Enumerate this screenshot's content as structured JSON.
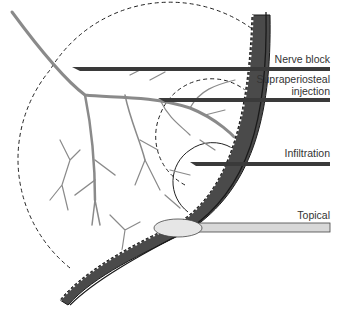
{
  "diagram": {
    "labels": {
      "nerve_block": "Nerve block",
      "supraperiosteal": "Supraperiosteal\ninjection",
      "infiltration": "Infiltration",
      "topical": "Topical"
    },
    "colors": {
      "nerve": "#8a8a8a",
      "mucosa_fill": "#4a4a4a",
      "bone_line": "#1a1a1a",
      "needle": "#3a3a3a",
      "dashed": "#222222",
      "swab": "#d8d8d8",
      "text": "#333333"
    },
    "techniques": [
      {
        "name": "Nerve block",
        "region": "large dashed circle"
      },
      {
        "name": "Supraperiosteal injection",
        "region": "medium dashed circle"
      },
      {
        "name": "Infiltration",
        "region": "small solid circle"
      },
      {
        "name": "Topical",
        "region": "surface swab"
      }
    ]
  }
}
